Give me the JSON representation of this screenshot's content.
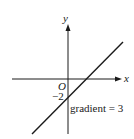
{
  "diagram": {
    "type": "line-graph-sketch",
    "axes": {
      "x_label": "x",
      "y_label": "y",
      "origin_label": "O"
    },
    "line": {
      "y_intercept_label": "−2",
      "annotation": "gradient = 3",
      "gradient": 3,
      "y_intercept": -2
    },
    "colors": {
      "ink": "#1a1a1a",
      "background": "#ffffff"
    }
  }
}
